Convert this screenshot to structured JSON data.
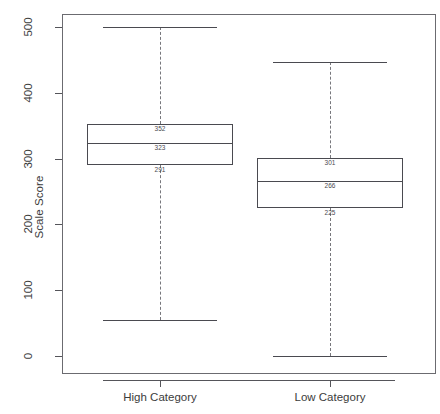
{
  "chart_data": {
    "type": "box",
    "title": "",
    "xlabel": "",
    "ylabel": "Scale Score",
    "categories": [
      "High Category",
      "Low Category"
    ],
    "ylim": [
      0,
      520
    ],
    "yticks": [
      0,
      100,
      200,
      300,
      400,
      500
    ],
    "ytick_labels": [
      "0",
      "100",
      "200",
      "300",
      "400",
      "500"
    ],
    "grid": false,
    "legend": null,
    "boxes": [
      {
        "category": "High Category",
        "whisker_low": 55,
        "q1": 291,
        "median": 323,
        "q3": 352,
        "whisker_high": 500,
        "labels": {
          "q3": "352",
          "median": "323",
          "q1": "291"
        }
      },
      {
        "category": "Low Category",
        "whisker_low": 0,
        "q1": 225,
        "median": 266,
        "q3": 301,
        "whisker_high": 447,
        "labels": {
          "q3": "301",
          "median": "266",
          "q1": "225"
        }
      }
    ]
  },
  "axis": {
    "y_title": "Scale Score",
    "y_ticks": [
      {
        "label": "500"
      },
      {
        "label": "400"
      },
      {
        "label": "300"
      },
      {
        "label": "200"
      },
      {
        "label": "100"
      },
      {
        "label": "0"
      }
    ],
    "x_ticks": [
      {
        "label": "High Category"
      },
      {
        "label": "Low Category"
      }
    ]
  },
  "colors": {
    "axis": "#55555a",
    "frame": "#6b6b70",
    "box_stroke": "#4a4a50",
    "whisker": "#77777c",
    "text": "#3c3c3c",
    "background": "#ffffff"
  }
}
